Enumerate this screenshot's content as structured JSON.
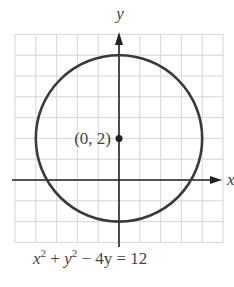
{
  "chart_data": {
    "type": "line",
    "title": "",
    "xlabel": "x",
    "ylabel": "y",
    "xlim": [
      -5,
      5
    ],
    "ylim": [
      -3,
      7
    ],
    "grid": true,
    "series": [
      {
        "name": "circle",
        "equation": "x^2 + y^2 - 4y = 12",
        "center": [
          0,
          2
        ],
        "radius": 4
      }
    ],
    "points": [
      {
        "x": 0,
        "y": 2,
        "label": "(0, 2)"
      }
    ],
    "caption": {
      "x": "x",
      "xexp": "2",
      "plus": " + ",
      "y": "y",
      "yexp": "2",
      "rest": " − 4y = 12"
    },
    "annotations": [
      "(0, 2)"
    ]
  }
}
